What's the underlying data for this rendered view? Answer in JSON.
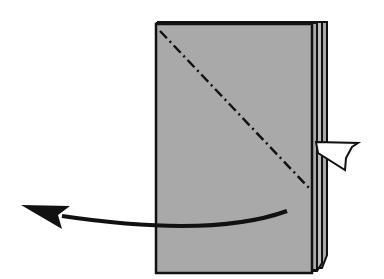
{
  "diagram": {
    "type": "origami-fold-step",
    "description": "Valley/mountain fold along diagonal dash-dot line, fold left flap behind",
    "colors": {
      "paper": "#a9a9a9",
      "outline": "#111111",
      "background": "#ffffff",
      "flap": "#ffffff"
    },
    "elements": {
      "paper": {
        "x": 156,
        "y": 24,
        "width": 156,
        "height": 249
      },
      "fold_line": {
        "style": "dash-dot",
        "from": [
          160,
          31
        ],
        "to": [
          311,
          190
        ]
      },
      "flap": {
        "points": "316,142 358,143 352,147 346,158 345,170 318,153"
      },
      "arrow": {
        "path": "M287,211 C240,228 170,232 62,216",
        "head": "21,205 70,206 58,215 62,229"
      }
    }
  }
}
